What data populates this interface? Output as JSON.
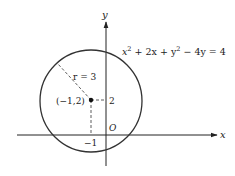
{
  "figure": {
    "axis_x_label": "x",
    "axis_y_label": "y",
    "origin_label": "O",
    "equation": {
      "x2": "x",
      "exp1": "2",
      "mid": " + 2x + y",
      "exp2": "2",
      "tail": " − 4y = 4"
    },
    "radius_label": "r = 3",
    "center_label": "(−1,2)",
    "tick_y_label": "2",
    "tick_x_label": "−1",
    "colors": {
      "stroke": "#222222",
      "background": "#ffffff"
    }
  },
  "diagram_data": {
    "type": "circle-on-coordinate-plane",
    "equation": "x^2 + 2x + y^2 - 4y = 4",
    "center": [
      -1,
      2
    ],
    "radius": 3
  }
}
